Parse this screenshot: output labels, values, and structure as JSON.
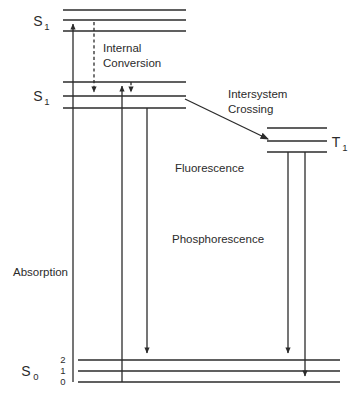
{
  "figure": {
    "kind": "jablonski-energy-level-diagram",
    "background_color": "#ffffff",
    "line_color": "#2b2b2b",
    "width": 359,
    "height": 398
  },
  "states": {
    "upper_singlet": {
      "label": "S",
      "subscript": "1",
      "label_x": 38,
      "label_y": 26,
      "levels": [
        {
          "y": 10,
          "x1": 63,
          "x2": 186
        },
        {
          "y": 20,
          "x1": 63,
          "x2": 186
        },
        {
          "y": 31,
          "x1": 63,
          "x2": 186
        }
      ]
    },
    "lower_singlet": {
      "label": "S",
      "subscript": "1",
      "label_x": 38,
      "label_y": 101,
      "levels": [
        {
          "y": 82,
          "x1": 63,
          "x2": 186
        },
        {
          "y": 96,
          "x1": 63,
          "x2": 186
        },
        {
          "y": 108,
          "x1": 63,
          "x2": 186
        }
      ]
    },
    "triplet": {
      "label": "T",
      "subscript": "1",
      "label_x": 332,
      "label_y": 147,
      "levels": [
        {
          "y": 128,
          "x1": 267,
          "x2": 327
        },
        {
          "y": 141,
          "x1": 267,
          "x2": 327
        },
        {
          "y": 152,
          "x1": 267,
          "x2": 327
        }
      ]
    },
    "ground": {
      "label": "S",
      "subscript": "0",
      "label_x": 24,
      "label_y": 376,
      "levels": [
        {
          "y": 360,
          "x1": 78,
          "x2": 340,
          "vib": "2",
          "vib_x": 63,
          "vib_y": 363
        },
        {
          "y": 371,
          "x1": 78,
          "x2": 340,
          "vib": "1",
          "vib_x": 63,
          "vib_y": 374
        },
        {
          "y": 382,
          "x1": 78,
          "x2": 340,
          "vib": "0",
          "vib_x": 63,
          "vib_y": 385
        }
      ]
    }
  },
  "transitions": {
    "absorption": {
      "name": "Absorption",
      "style": "solid",
      "direction": "up",
      "x": 73,
      "y_start": 382,
      "y_end": 18,
      "label": "Absorption",
      "label_x": 13,
      "label_y": 276
    },
    "internal_conversion_upper": {
      "name": "Internal Conversion (S2 to S1)",
      "style": "dashed",
      "direction": "down",
      "x": 94,
      "y_start": 22,
      "y_end": 98,
      "label": "Internal",
      "label2": "Conversion",
      "label_x": 103,
      "label_y": 52,
      "label2_y": 67
    },
    "vibrational_excitation": {
      "name": "vertical-riser",
      "style": "solid",
      "direction": "up",
      "x": 122,
      "y_start": 382,
      "y_end": 80
    },
    "internal_conversion_lower": {
      "name": "Internal Conversion (vibrational relaxation)",
      "style": "dashed",
      "direction": "down",
      "x": 131,
      "y_start": 82,
      "y_end": 98
    },
    "fluorescence": {
      "name": "Fluorescence",
      "style": "solid",
      "direction": "down",
      "x": 147,
      "y_start": 108,
      "y_end": 358,
      "label": "Fluorescence",
      "label_x": 175,
      "label_y": 172
    },
    "intersystem_crossing": {
      "name": "Intersystem Crossing",
      "style": "solid-diagonal",
      "x1": 185,
      "y1": 99,
      "x2": 272,
      "y2": 141,
      "label": "Intersystem",
      "label2": "Crossing",
      "label_x": 228,
      "label_y": 98,
      "label2_y": 113
    },
    "phosphorescence_a": {
      "name": "Phosphorescence (to v=2)",
      "style": "solid",
      "direction": "down",
      "x": 288,
      "y_start": 152,
      "y_end": 358,
      "label": "Phosphorescence",
      "label_x": 172,
      "label_y": 243
    },
    "phosphorescence_b": {
      "name": "Phosphorescence (to v=0)",
      "style": "solid",
      "direction": "down",
      "x": 305,
      "y_start": 152,
      "y_end": 381
    }
  }
}
